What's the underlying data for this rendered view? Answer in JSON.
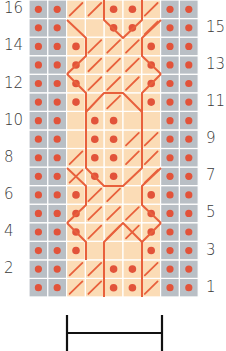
{
  "chart_data": {
    "type": "knitting-chart",
    "rows": 16,
    "columns": 9,
    "column_layout": [
      "gray",
      "gray",
      "peach",
      "peach",
      "peach",
      "peach",
      "peach",
      "gray",
      "gray"
    ],
    "row_labels_left": [
      "16",
      "14",
      "12",
      "10",
      "8",
      "6",
      "4",
      "2"
    ],
    "row_labels_right": [
      "15",
      "13",
      "11",
      "9",
      "7",
      "5",
      "3",
      "1"
    ],
    "colors": {
      "background_stitch": "#b9bfc5",
      "cable_panel": "#fbdcb6",
      "dot": "#e2533a",
      "cable_line": "#e8603c",
      "grid": "#ffffff",
      "bracket": "#111111",
      "label": "#3a3a3a"
    },
    "peach_dots": [
      {
        "row": 16,
        "col": 3
      },
      {
        "row": 16,
        "col": 4
      },
      {
        "row": 15,
        "col": 3
      },
      {
        "row": 15,
        "col": 4
      },
      {
        "row": 14,
        "col": 1
      },
      {
        "row": 14,
        "col": 5
      },
      {
        "row": 13,
        "col": 1
      },
      {
        "row": 13,
        "col": 5
      },
      {
        "row": 12,
        "col": 1
      },
      {
        "row": 12,
        "col": 5
      },
      {
        "row": 11,
        "col": 1
      },
      {
        "row": 11,
        "col": 5
      },
      {
        "row": 10,
        "col": 2
      },
      {
        "row": 10,
        "col": 3
      },
      {
        "row": 9,
        "col": 2
      },
      {
        "row": 9,
        "col": 3
      },
      {
        "row": 8,
        "col": 2
      },
      {
        "row": 8,
        "col": 3
      },
      {
        "row": 7,
        "col": 2
      },
      {
        "row": 7,
        "col": 3
      },
      {
        "row": 6,
        "col": 1
      },
      {
        "row": 6,
        "col": 5
      },
      {
        "row": 5,
        "col": 1
      },
      {
        "row": 5,
        "col": 5
      },
      {
        "row": 4,
        "col": 1
      },
      {
        "row": 4,
        "col": 5
      },
      {
        "row": 3,
        "col": 1
      },
      {
        "row": 3,
        "col": 5
      },
      {
        "row": 2,
        "col": 3
      },
      {
        "row": 2,
        "col": 4
      },
      {
        "row": 1,
        "col": 3
      },
      {
        "row": 1,
        "col": 4
      }
    ],
    "cable_polylines": [
      "67,20 86,38 86,56 67,74",
      "67,74 86,93 86,112",
      "104,0 104,20 123,38 142,20 142,0",
      "161,20 142,38 142,56 161,74",
      "161,74 142,93 142,112",
      "86,112 104,93 123,93 142,112",
      "86,112 86,168 104,186 123,186 142,168 142,112",
      "67,168 86,186 86,205 67,223",
      "161,168 142,186 142,205 161,223",
      "67,223 86,242 86,260",
      "161,223 142,242 142,260",
      "104,297 104,242 123,223 142,242 142,297"
    ],
    "cable_slashes": [
      {
        "row": 16,
        "col": 1
      },
      {
        "row": 16,
        "col": 2
      },
      {
        "row": 16,
        "col": 5
      },
      {
        "row": 15,
        "col": 5
      },
      {
        "row": 14,
        "col": 2
      },
      {
        "row": 14,
        "col": 3
      },
      {
        "row": 14,
        "col": 4
      },
      {
        "row": 13,
        "col": 2
      },
      {
        "row": 13,
        "col": 3
      },
      {
        "row": 13,
        "col": 4
      },
      {
        "row": 12,
        "col": 2
      },
      {
        "row": 12,
        "col": 3
      },
      {
        "row": 12,
        "col": 4
      },
      {
        "row": 11,
        "col": 3
      },
      {
        "row": 9,
        "col": 4
      },
      {
        "row": 9,
        "col": 5
      },
      {
        "row": 8,
        "col": 1
      },
      {
        "row": 8,
        "col": 4
      },
      {
        "row": 8,
        "col": 5
      },
      {
        "row": 7,
        "col": 1
      },
      {
        "row": 7,
        "col": 5
      },
      {
        "row": 6,
        "col": 2
      },
      {
        "row": 6,
        "col": 3
      },
      {
        "row": 5,
        "col": 2
      },
      {
        "row": 5,
        "col": 3
      },
      {
        "row": 5,
        "col": 4
      },
      {
        "row": 4,
        "col": 2
      },
      {
        "row": 4,
        "col": 3
      },
      {
        "row": 4,
        "col": 4
      },
      {
        "row": 2,
        "col": 1
      },
      {
        "row": 2,
        "col": 2
      },
      {
        "row": 2,
        "col": 5
      },
      {
        "row": 1,
        "col": 1
      },
      {
        "row": 1,
        "col": 2
      },
      {
        "row": 1,
        "col": 5
      }
    ],
    "bracket": {
      "x1": 67,
      "x2": 162,
      "y_top": 315,
      "y_mid": 333,
      "y_bottom": 351
    }
  }
}
